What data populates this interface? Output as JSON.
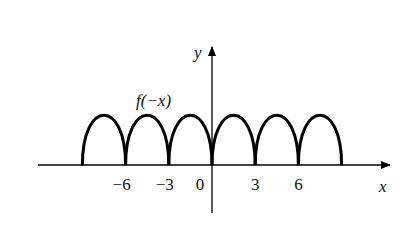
{
  "chart_data": {
    "type": "line",
    "title": "",
    "curve_label": "f(−x)",
    "xlabel": "x",
    "ylabel": "y",
    "x_ticks": [
      -6,
      -3,
      0,
      3,
      6
    ],
    "x_tick_labels": [
      "−6",
      "−3",
      "0",
      "3",
      "6"
    ],
    "xlim": [
      -12,
      12
    ],
    "grid": false,
    "legend": "none",
    "arches": [
      {
        "x_start": -9,
        "x_end": -6,
        "peak": 1
      },
      {
        "x_start": -6,
        "x_end": -3,
        "peak": 1
      },
      {
        "x_start": -3,
        "x_end": 0,
        "peak": 1
      },
      {
        "x_start": 0,
        "x_end": 3,
        "peak": 1
      },
      {
        "x_start": 3,
        "x_end": 6,
        "peak": 1
      },
      {
        "x_start": 6,
        "x_end": 9,
        "peak": 1
      }
    ]
  },
  "colors": {
    "stroke": "#000000",
    "background": "#ffffff"
  }
}
